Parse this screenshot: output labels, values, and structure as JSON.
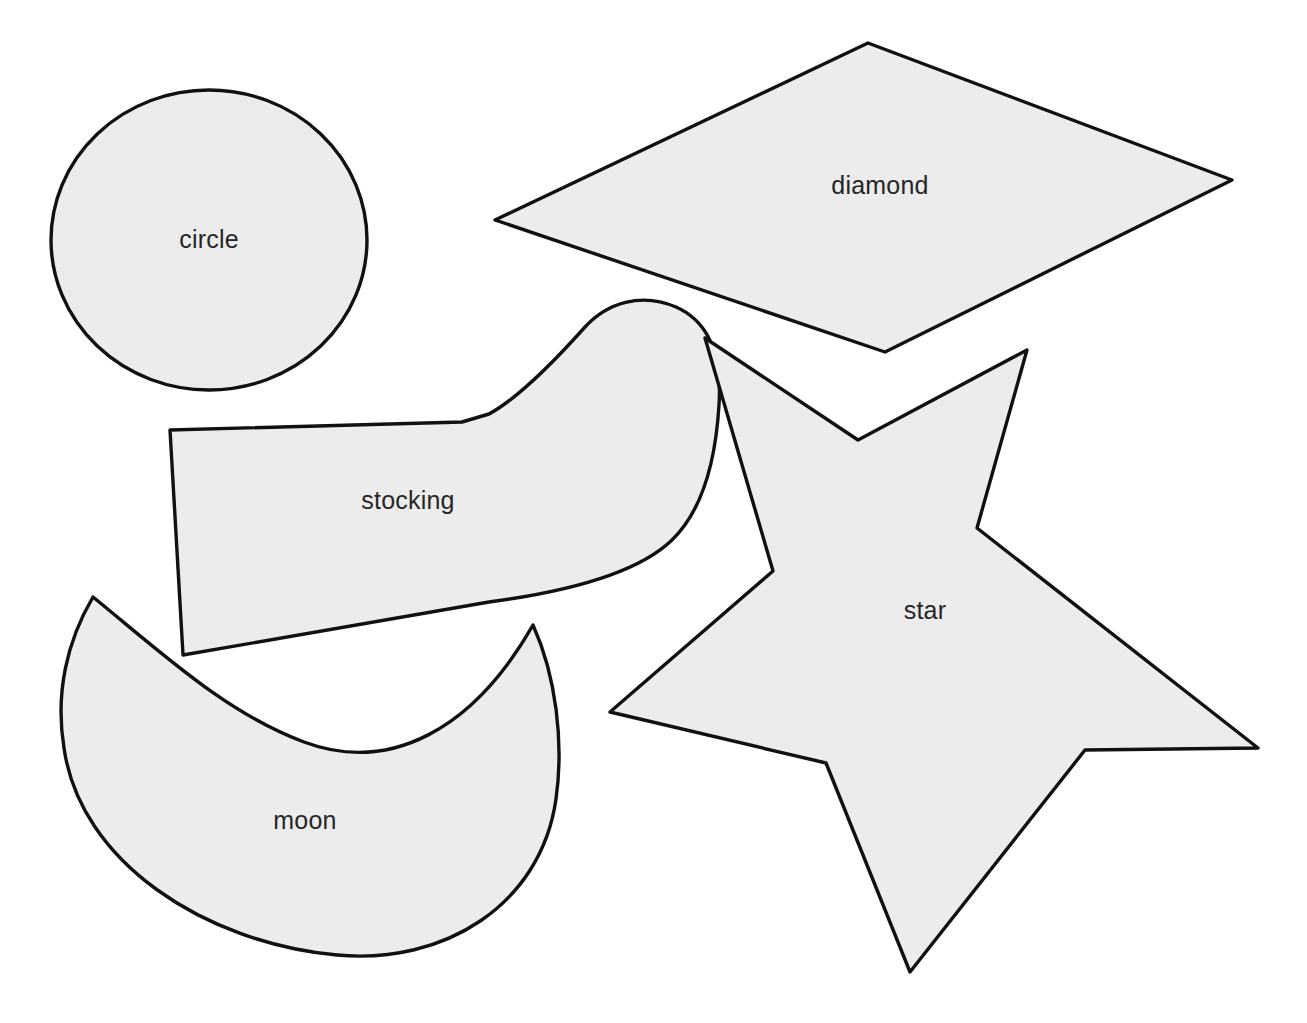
{
  "page": {
    "background_color": "#ffffff",
    "width": 1307,
    "height": 1023
  },
  "style": {
    "shape_fill": "#ececec",
    "shape_outline": "#111111",
    "label_color": "#262626",
    "outline_width": 3.4,
    "label_font_size": 25
  },
  "shapes": [
    {
      "id": "circle",
      "label": "circle",
      "label_x": 209,
      "label_y": 239,
      "geometry_type": "ellipse",
      "cx": 209,
      "cy": 240,
      "rx": 158,
      "ry": 150
    },
    {
      "id": "diamond",
      "label": "diamond",
      "label_x": 880,
      "label_y": 185,
      "geometry_type": "polygon",
      "points": "868,43 1232,180 885,352 495,220"
    },
    {
      "id": "stocking",
      "label": "stocking",
      "label_x": 408,
      "label_y": 500,
      "geometry_type": "path",
      "d": "M 170,430 L 183,655 L 489,602 C 580,590 641,570 672,540 C 705,508 716,455 719,405 C 722,358 710,322 676,307 C 641,292 607,303 585,327 C 560,355 520,397 489,414 L 462,422 Z"
    },
    {
      "id": "star",
      "label": "star",
      "label_x": 925,
      "label_y": 610,
      "geometry_type": "polygon",
      "points": "705,338 858,440 1027,350 977,528 1258,748 1085,750 910,972 826,763 610,712 773,571"
    },
    {
      "id": "moon",
      "label": "moon",
      "label_x": 305,
      "label_y": 820,
      "geometry_type": "path",
      "d": "M 93,597 C 163,654 226,713 304,742 C 390,774 473,730 533,625 C 556,676 564,742 556,799 C 541,905 444,965 337,955 C 205,943 80,862 64,748 C 55,693 67,641 93,597 Z"
    }
  ]
}
